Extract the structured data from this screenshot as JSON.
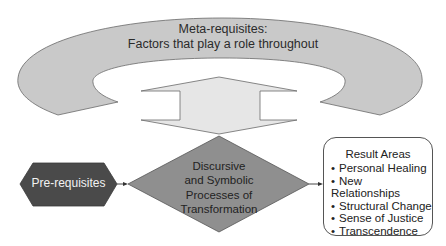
{
  "diagram": {
    "meta_requisites": {
      "line1": "Meta-requisites:",
      "line2": "Factors that play a role throughout",
      "fill": "#c9c9c9"
    },
    "double_arrow": {
      "fill": "#e6e6e6"
    },
    "pre_requisites": {
      "label": "Pre-requisites",
      "fill": "#4a4a4a"
    },
    "process": {
      "line1": "Discursive",
      "line2": "and Symbolic",
      "line3": "Processes of",
      "line4": "Transformation",
      "fill": "#8f8f8f"
    },
    "result_areas": {
      "title": "Result Areas",
      "items": [
        "Personal Healing",
        "New Relationships",
        "Structural Change",
        "Sense of Justice",
        "Transcendence"
      ]
    }
  }
}
